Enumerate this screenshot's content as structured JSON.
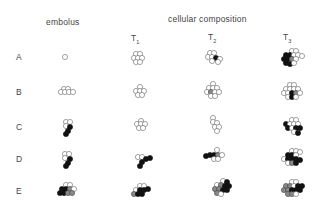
{
  "headers": {
    "embolus": "embolus",
    "composition": "cellular composition"
  },
  "time_points": [
    {
      "base": "T",
      "sub": "1"
    },
    {
      "base": "T",
      "sub": "2"
    },
    {
      "base": "T",
      "sub": "3"
    }
  ],
  "rows": [
    "A",
    "B",
    "C",
    "D",
    "E"
  ],
  "legend_colors": {
    "open_cell": "#ffffff",
    "filled_cell": "#111111",
    "grey_cell": "#888888",
    "stroke": "#555555"
  }
}
